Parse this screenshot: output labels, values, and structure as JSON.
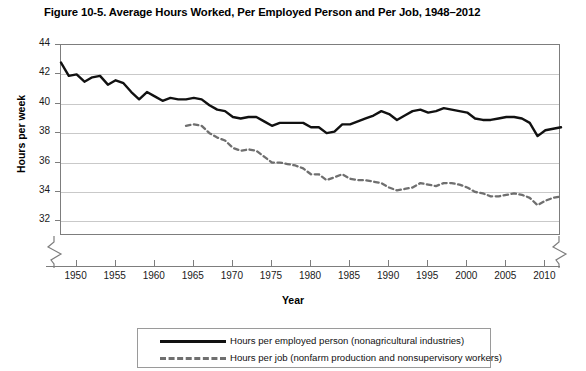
{
  "chart_data": {
    "type": "line",
    "title": "Figure 10-5. Average Hours Worked, Per Employed Person and Per Job, 1948–2012",
    "xlabel": "Year",
    "ylabel": "Hours per week",
    "xlim": [
      1948,
      2012
    ],
    "ylim": [
      31,
      44
    ],
    "ytick_labels": [
      "32",
      "34",
      "36",
      "38",
      "40",
      "42",
      "44"
    ],
    "yticks": [
      32,
      34,
      36,
      38,
      40,
      42,
      44
    ],
    "xtick_labels": [
      "1950",
      "1955",
      "1960",
      "1965",
      "1970",
      "1975",
      "1980",
      "1985",
      "1990",
      "1995",
      "2000",
      "2005",
      "2010"
    ],
    "xticks": [
      1950,
      1955,
      1960,
      1965,
      1970,
      1975,
      1980,
      1985,
      1990,
      1995,
      2000,
      2005,
      2010
    ],
    "grid": true,
    "grid_axis": "y",
    "axis_break_y": true,
    "axis_break_x": true,
    "legend_position": "bottom",
    "series": [
      {
        "name": "Hours per employed person (nonagricultural industries)",
        "style": "solid",
        "color": "#111111",
        "x": [
          1948,
          1949,
          1950,
          1951,
          1952,
          1953,
          1954,
          1955,
          1956,
          1957,
          1958,
          1959,
          1960,
          1961,
          1962,
          1963,
          1964,
          1965,
          1966,
          1967,
          1968,
          1969,
          1970,
          1971,
          1972,
          1973,
          1974,
          1975,
          1976,
          1977,
          1978,
          1979,
          1980,
          1981,
          1982,
          1983,
          1984,
          1985,
          1986,
          1987,
          1988,
          1989,
          1990,
          1991,
          1992,
          1993,
          1994,
          1995,
          1996,
          1997,
          1998,
          1999,
          2000,
          2001,
          2002,
          2003,
          2004,
          2005,
          2006,
          2007,
          2008,
          2009,
          2010,
          2011,
          2012
        ],
        "y": [
          42.8,
          41.9,
          42.0,
          41.5,
          41.8,
          41.9,
          41.3,
          41.6,
          41.4,
          40.8,
          40.3,
          40.8,
          40.5,
          40.2,
          40.4,
          40.3,
          40.3,
          40.4,
          40.3,
          39.9,
          39.6,
          39.5,
          39.1,
          39.0,
          39.1,
          39.1,
          38.8,
          38.5,
          38.7,
          38.7,
          38.7,
          38.7,
          38.4,
          38.4,
          38.0,
          38.1,
          38.6,
          38.6,
          38.8,
          39.0,
          39.2,
          39.5,
          39.3,
          38.9,
          39.2,
          39.5,
          39.6,
          39.4,
          39.5,
          39.7,
          39.6,
          39.5,
          39.4,
          39.0,
          38.9,
          38.9,
          39.0,
          39.1,
          39.1,
          39.0,
          38.7,
          37.8,
          38.2,
          38.3,
          38.4
        ]
      },
      {
        "name": "Hours per job (nonfarm production and nonsupervisory workers)",
        "style": "dashed",
        "color": "#6f6f6f",
        "x": [
          1964,
          1965,
          1966,
          1967,
          1968,
          1969,
          1970,
          1971,
          1972,
          1973,
          1974,
          1975,
          1976,
          1977,
          1978,
          1979,
          1980,
          1981,
          1982,
          1983,
          1984,
          1985,
          1986,
          1987,
          1988,
          1989,
          1990,
          1991,
          1992,
          1993,
          1994,
          1995,
          1996,
          1997,
          1998,
          1999,
          2000,
          2001,
          2002,
          2003,
          2004,
          2005,
          2006,
          2007,
          2008,
          2009,
          2010,
          2011,
          2012
        ],
        "y": [
          38.5,
          38.6,
          38.5,
          38.0,
          37.7,
          37.5,
          37.0,
          36.8,
          36.9,
          36.8,
          36.4,
          36.0,
          36.0,
          35.9,
          35.8,
          35.6,
          35.2,
          35.2,
          34.8,
          35.0,
          35.2,
          34.9,
          34.8,
          34.8,
          34.7,
          34.6,
          34.3,
          34.1,
          34.2,
          34.3,
          34.6,
          34.5,
          34.4,
          34.6,
          34.6,
          34.5,
          34.3,
          34.0,
          33.9,
          33.7,
          33.7,
          33.8,
          33.9,
          33.8,
          33.6,
          33.1,
          33.4,
          33.6,
          33.7
        ]
      }
    ]
  },
  "legend": {
    "items": [
      {
        "label": "Hours per employed person (nonagricultural industries)",
        "style": "solid"
      },
      {
        "label": "Hours per job (nonfarm production and nonsupervisory workers)",
        "style": "dashed"
      }
    ]
  }
}
